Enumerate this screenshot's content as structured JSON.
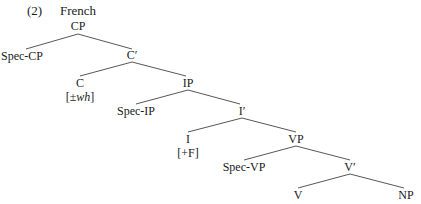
{
  "example_number": "(2)",
  "title": "French",
  "nodes": {
    "CP": "CP",
    "SpecCP": "Spec-CP",
    "Cbar": "C′",
    "C": "C",
    "C_feature": "[±wh]",
    "IP": "IP",
    "SpecIP": "Spec-IP",
    "Ibar": "I′",
    "I": "I",
    "I_feature": "[+F]",
    "VP": "VP",
    "SpecVP": "Spec-VP",
    "Vbar": "V′",
    "V": "V",
    "NP": "NP"
  },
  "edges": [
    [
      "CP",
      "SpecCP"
    ],
    [
      "CP",
      "Cbar"
    ],
    [
      "Cbar",
      "C"
    ],
    [
      "Cbar",
      "IP"
    ],
    [
      "IP",
      "SpecIP"
    ],
    [
      "IP",
      "Ibar"
    ],
    [
      "Ibar",
      "I"
    ],
    [
      "Ibar",
      "VP"
    ],
    [
      "VP",
      "SpecVP"
    ],
    [
      "VP",
      "Vbar"
    ],
    [
      "Vbar",
      "V"
    ],
    [
      "Vbar",
      "NP"
    ]
  ]
}
